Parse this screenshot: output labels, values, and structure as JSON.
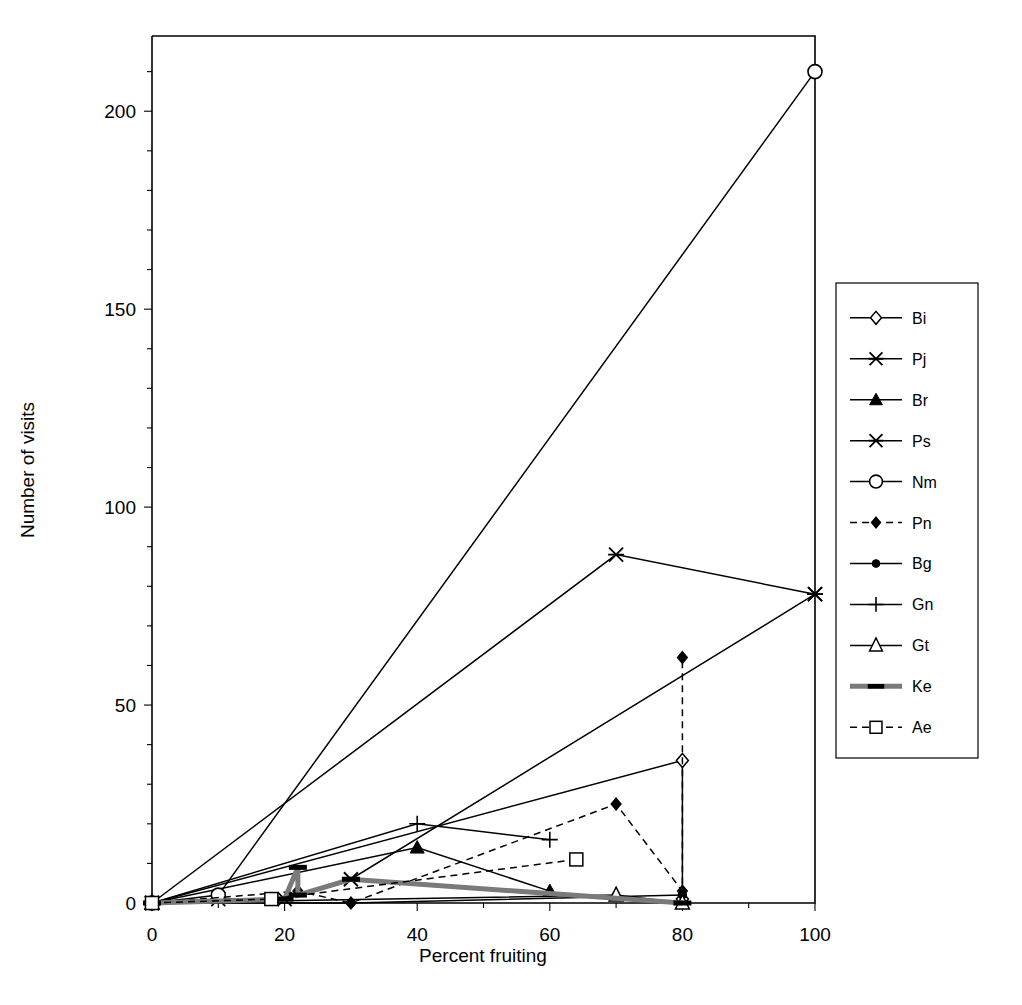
{
  "chart_data": {
    "type": "line",
    "title": "",
    "xlabel": "Percent fruiting",
    "ylabel": "Number of visits",
    "xlim": [
      0,
      100
    ],
    "ylim": [
      0,
      219
    ],
    "xticks": [
      0,
      20,
      40,
      60,
      80,
      100
    ],
    "xtick_labels": [
      "0",
      "20",
      "40",
      "60",
      "80",
      "100"
    ],
    "xminor_step": 10,
    "yticks": [
      0,
      50,
      100,
      150,
      200
    ],
    "ytick_labels": [
      "0",
      "50",
      "100",
      "150",
      "200"
    ],
    "yminor_step": 10,
    "grid": false,
    "legend_position": "right",
    "series": [
      {
        "name": "Bi",
        "marker": "diamond-open",
        "dash": "solid",
        "color": "#000000",
        "points": [
          [
            0,
            0
          ],
          [
            80,
            36
          ],
          [
            80,
            1
          ]
        ]
      },
      {
        "name": "Pj",
        "marker": "star-x",
        "dash": "solid",
        "color": "#000000",
        "points": [
          [
            0,
            0
          ],
          [
            10,
            1
          ],
          [
            20,
            1
          ],
          [
            30,
            6
          ],
          [
            100,
            78
          ]
        ]
      },
      {
        "name": "Br",
        "marker": "triangle-filled",
        "dash": "solid",
        "color": "#000000",
        "points": [
          [
            0,
            0
          ],
          [
            40,
            14
          ],
          [
            60,
            3
          ]
        ]
      },
      {
        "name": "Ps",
        "marker": "star-x",
        "dash": "solid",
        "color": "#000000",
        "points": [
          [
            0,
            0
          ],
          [
            70,
            88
          ],
          [
            100,
            78
          ]
        ]
      },
      {
        "name": "Nm",
        "marker": "circle-open",
        "dash": "solid",
        "color": "#000000",
        "points": [
          [
            0,
            0
          ],
          [
            10,
            2
          ],
          [
            100,
            210
          ]
        ]
      },
      {
        "name": "Pn",
        "marker": "diamond-filled",
        "dash": "dashed",
        "color": "#000000",
        "points": [
          [
            0,
            0
          ],
          [
            22,
            3
          ],
          [
            30,
            0
          ],
          [
            70,
            25
          ],
          [
            80,
            3
          ],
          [
            80,
            62
          ]
        ]
      },
      {
        "name": "Bg",
        "marker": "circle-filled",
        "dash": "solid",
        "color": "#000000",
        "points": [
          [
            0,
            0
          ],
          [
            30,
            0
          ],
          [
            80,
            2
          ]
        ]
      },
      {
        "name": "Gn",
        "marker": "plus",
        "dash": "solid",
        "color": "#000000",
        "points": [
          [
            0,
            0
          ],
          [
            40,
            20
          ],
          [
            60,
            16
          ]
        ]
      },
      {
        "name": "Gt",
        "marker": "triangle-open",
        "dash": "solid",
        "color": "#000000",
        "points": [
          [
            0,
            0
          ],
          [
            70,
            2
          ],
          [
            80,
            0
          ]
        ]
      },
      {
        "name": "Ke",
        "marker": "thick-bar",
        "dash": "solid-thick",
        "color": "#7a7a7a",
        "points": [
          [
            0,
            0
          ],
          [
            20,
            1
          ],
          [
            22,
            9
          ],
          [
            22,
            2
          ],
          [
            30,
            6
          ],
          [
            80,
            0
          ]
        ]
      },
      {
        "name": "Ae",
        "marker": "square-open",
        "dash": "dashed",
        "color": "#000000",
        "points": [
          [
            0,
            0
          ],
          [
            18,
            1
          ],
          [
            64,
            11
          ]
        ]
      }
    ],
    "legend_entries": [
      {
        "label": "Bi",
        "marker": "diamond-open",
        "dash": "solid"
      },
      {
        "label": "Pj",
        "marker": "star-x",
        "dash": "solid"
      },
      {
        "label": "Br",
        "marker": "triangle-filled",
        "dash": "solid"
      },
      {
        "label": "Ps",
        "marker": "star-x",
        "dash": "solid"
      },
      {
        "label": "Nm",
        "marker": "circle-open",
        "dash": "solid"
      },
      {
        "label": "Pn",
        "marker": "diamond-filled",
        "dash": "dashed"
      },
      {
        "label": "Bg",
        "marker": "circle-filled",
        "dash": "solid"
      },
      {
        "label": "Gn",
        "marker": "plus",
        "dash": "solid"
      },
      {
        "label": "Gt",
        "marker": "triangle-open",
        "dash": "solid"
      },
      {
        "label": "Ke",
        "marker": "thick-bar",
        "dash": "solid-thick"
      },
      {
        "label": "Ae",
        "marker": "square-open",
        "dash": "dashed"
      }
    ]
  },
  "axes": {
    "x_title": "Percent fruiting",
    "y_title": "Number of visits"
  }
}
